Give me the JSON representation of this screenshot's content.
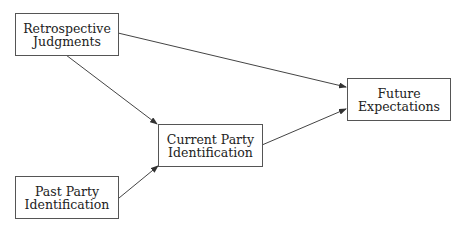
{
  "nodes": {
    "retrospective": {
      "line1": "Retrospective",
      "line2": "Judgments"
    },
    "future": {
      "line1": "Future",
      "line2": "Expectations"
    },
    "current": {
      "line1": "Current Party",
      "line2": "Identification"
    },
    "past": {
      "line1": "Past Party",
      "line2": "Identification"
    }
  },
  "edges": [
    {
      "from": "Retrospective Judgments",
      "to": "Future Expectations"
    },
    {
      "from": "Retrospective Judgments",
      "to": "Current Party Identification"
    },
    {
      "from": "Past Party Identification",
      "to": "Current Party Identification"
    },
    {
      "from": "Current Party Identification",
      "to": "Future Expectations"
    }
  ]
}
